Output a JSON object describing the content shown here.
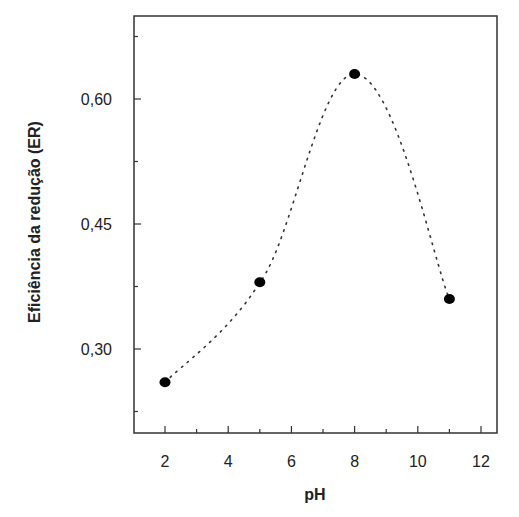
{
  "chart_data": {
    "type": "scatter",
    "title": "",
    "xlabel": "pH",
    "ylabel": "Eficiência da redução (ER)",
    "x": [
      2,
      5,
      8,
      11
    ],
    "series": [
      {
        "name": "ER",
        "x": [
          2,
          5,
          8,
          11
        ],
        "values": [
          0.26,
          0.38,
          0.63,
          0.36
        ]
      }
    ],
    "fit_curve": "dotted smooth curve through points",
    "xlim": [
      1,
      12.5
    ],
    "ylim": [
      0.2,
      0.7
    ],
    "x_ticks": [
      "2",
      "4",
      "6",
      "8",
      "10",
      "12"
    ],
    "y_ticks": [
      "0,30",
      "0,45",
      "0,60"
    ],
    "grid": false,
    "legend": null
  },
  "colors": {
    "marker": "#000000",
    "axis": "#333333",
    "curve": "#333333"
  }
}
